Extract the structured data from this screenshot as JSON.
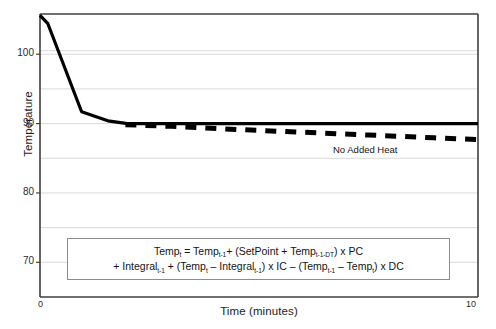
{
  "chart_data": {
    "type": "line",
    "title": "",
    "xlabel": "Time (minutes)",
    "ylabel": "Temperature",
    "xlim": [
      0,
      10
    ],
    "ylim": [
      65,
      105.8
    ],
    "xticks": [
      "0",
      "10"
    ],
    "yticks": [
      "70",
      "80",
      "90",
      "100"
    ],
    "yminor": [
      75,
      85,
      95,
      100.5
    ],
    "grid": "horizontal",
    "legend": "none",
    "series": [
      {
        "name": "Controlled Temperature",
        "style": "solid",
        "color": "#000000",
        "x": [
          0,
          0.18,
          0.95,
          1.55,
          2.0,
          4.0,
          6.0,
          8.0,
          10.0
        ],
        "y": [
          105.6,
          104.4,
          91.7,
          90.4,
          90.0,
          90.0,
          90.0,
          90.0,
          90.0
        ]
      },
      {
        "name": "No Added Heat",
        "style": "dashed",
        "color": "#000000",
        "x": [
          1.95,
          3.0,
          4.5,
          6.0,
          7.5,
          9.0,
          10.0
        ],
        "y": [
          89.85,
          89.6,
          89.15,
          88.75,
          88.35,
          87.95,
          87.7
        ]
      }
    ],
    "annotations": [
      {
        "text": "No Added Heat",
        "x": 6.6,
        "y": 88.6
      }
    ]
  },
  "formula": {
    "line1": [
      {
        "t": "Temp"
      },
      {
        "sub": "t"
      },
      {
        "t": " = Temp"
      },
      {
        "sub": "t-1"
      },
      {
        "t": "+ (SetPoint + Temp"
      },
      {
        "sub": "t-1-DT"
      },
      {
        "t": ") x PC"
      }
    ],
    "line2": [
      {
        "t": "+ Integral"
      },
      {
        "sub": "t-1"
      },
      {
        "t": " + (Temp"
      },
      {
        "sub": "t"
      },
      {
        "t": " – Integral"
      },
      {
        "sub": "t-1"
      },
      {
        "t": ") x IC – (Temp"
      },
      {
        "sub": "t-1"
      },
      {
        "t": " – Temp"
      },
      {
        "sub": "t"
      },
      {
        "t": ") x DC"
      }
    ],
    "line1_plain": "Tempt = Tempt-1+ (SetPoint + Tempt-1-DT) x PC",
    "line2_plain": "+ Integralt-1 + (Tempt – Integralt-1) x IC – (Tempt-1 – Tempt) x DC"
  },
  "colors": {
    "axis": "#3f3f3f",
    "grid": "#d9d9d9",
    "series": "#000000",
    "box_border": "#8c8c8c",
    "background": "#ffffff"
  }
}
